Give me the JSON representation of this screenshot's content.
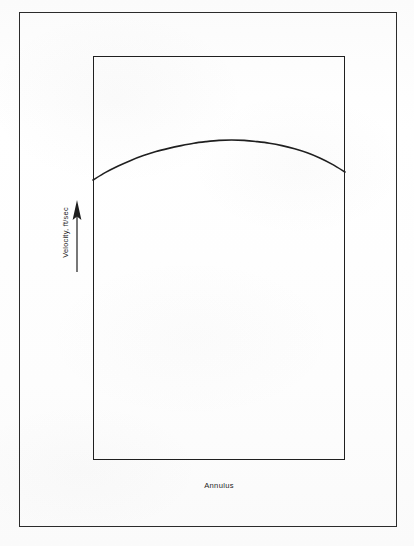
{
  "figure": {
    "background_color": "#fdfdfd",
    "ink_color": "#1f1f1f",
    "outer_border_color": "#2b2b2b"
  },
  "axes": {
    "y_label": "Velocity, ft/sec",
    "y_arrow_icon": "up-arrow-icon",
    "y_arrow_direction": "up",
    "x_label": "Annulus"
  },
  "chart_data": {
    "type": "line",
    "title": "",
    "subtitle": "",
    "xlabel": "Annulus",
    "ylabel": "Velocity, ft/sec",
    "grid": false,
    "legend": null,
    "xlim": [
      0,
      1
    ],
    "ylim": [
      0,
      1
    ],
    "axis_tick_labels": {
      "x": [],
      "y": []
    },
    "annotations": [],
    "series": [
      {
        "name": "Velocity profile",
        "description": "Parabolic velocity profile across the annulus; zero-slope maximum near mid-width, falling toward both walls.",
        "color": "#1f1f1f",
        "line_width_px": 1.6,
        "x": [
          0.0,
          0.05,
          0.1,
          0.15,
          0.2,
          0.25,
          0.3,
          0.35,
          0.4,
          0.45,
          0.5,
          0.55,
          0.6,
          0.65,
          0.7,
          0.75,
          0.8,
          0.85,
          0.9,
          0.95,
          1.0
        ],
        "values": [
          0.0,
          0.19,
          0.35,
          0.49,
          0.61,
          0.71,
          0.79,
          0.86,
          0.92,
          0.96,
          0.99,
          1.0,
          0.99,
          0.96,
          0.92,
          0.86,
          0.78,
          0.68,
          0.55,
          0.39,
          0.2
        ]
      }
    ]
  }
}
